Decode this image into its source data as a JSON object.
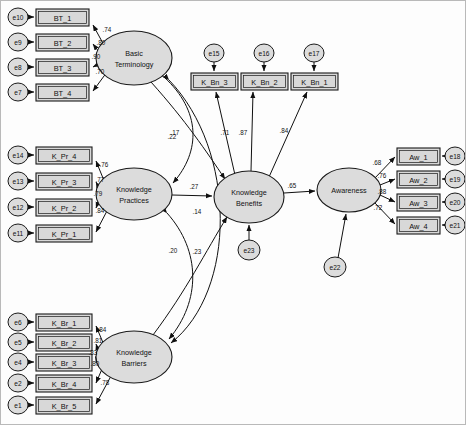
{
  "diagram": {
    "type": "sem-path-diagram",
    "latents": [
      {
        "id": "BT",
        "label_line1": "Basic",
        "label_line2": "Terminology",
        "cx": 133,
        "cy": 57,
        "rx": 38,
        "ry": 27
      },
      {
        "id": "KP",
        "label_line1": "Knowledge",
        "label_line2": "Practices",
        "cx": 133,
        "cy": 193,
        "rx": 38,
        "ry": 26
      },
      {
        "id": "KB",
        "label_line1": "Knowledge",
        "label_line2": "Barriers",
        "cx": 133,
        "cy": 356,
        "rx": 38,
        "ry": 26
      },
      {
        "id": "KBN",
        "label_line1": "Knowledge",
        "label_line2": "Benefits",
        "cx": 248,
        "cy": 196,
        "rx": 35,
        "ry": 26
      },
      {
        "id": "AW",
        "label_line1": "Awareness",
        "label_line2": "",
        "cx": 348,
        "cy": 189,
        "rx": 32,
        "ry": 22
      }
    ],
    "indicators": [
      {
        "id": "BT_1",
        "label": "BT_1",
        "x": 35,
        "y": 8,
        "w": 53,
        "h": 17,
        "err": "e10",
        "err_cx": 17,
        "err_cy": 16,
        "loading": ".74"
      },
      {
        "id": "BT_2",
        "label": "BT_2",
        "x": 35,
        "y": 33,
        "w": 53,
        "h": 17,
        "err": "e9",
        "err_cx": 17,
        "err_cy": 41,
        "loading": ".80"
      },
      {
        "id": "BT_3",
        "label": "BT_3",
        "x": 35,
        "y": 58,
        "w": 53,
        "h": 17,
        "err": "e8",
        "err_cx": 17,
        "err_cy": 66,
        "loading": ".90"
      },
      {
        "id": "BT_4",
        "label": "BT_4",
        "x": 35,
        "y": 83,
        "w": 53,
        "h": 17,
        "err": "e7",
        "err_cx": 17,
        "err_cy": 91,
        "loading": ".70"
      },
      {
        "id": "K_Pr_4",
        "label": "K_Pr_4",
        "x": 35,
        "y": 146,
        "w": 56,
        "h": 17,
        "err": "e14",
        "err_cx": 17,
        "err_cy": 154,
        "loading": ".76"
      },
      {
        "id": "K_Pr_3",
        "label": "K_Pr_3",
        "x": 35,
        "y": 172,
        "w": 56,
        "h": 17,
        "err": "e13",
        "err_cx": 17,
        "err_cy": 180,
        "loading": ".77"
      },
      {
        "id": "K_Pr_2",
        "label": "K_Pr_2",
        "x": 35,
        "y": 198,
        "w": 56,
        "h": 17,
        "err": "e12",
        "err_cx": 17,
        "err_cy": 206,
        "loading": ".79"
      },
      {
        "id": "K_Pr_1",
        "label": "K_Pr_1",
        "x": 35,
        "y": 224,
        "w": 56,
        "h": 17,
        "err": "e11",
        "err_cx": 17,
        "err_cy": 232,
        "loading": ".84"
      },
      {
        "id": "K_Br_1",
        "label": "K_Br_1",
        "x": 35,
        "y": 313,
        "w": 56,
        "h": 17,
        "err": "e6",
        "err_cx": 17,
        "err_cy": 321,
        "loading": ".84"
      },
      {
        "id": "K_Br_2",
        "label": "K_Br_2",
        "x": 35,
        "y": 333,
        "w": 56,
        "h": 17,
        "err": "e5",
        "err_cx": 17,
        "err_cy": 341,
        "loading": ".81"
      },
      {
        "id": "K_Br_3",
        "label": "K_Br_3",
        "x": 35,
        "y": 353,
        "w": 56,
        "h": 17,
        "err": "e4",
        "err_cx": 17,
        "err_cy": 361,
        "loading": ".83"
      },
      {
        "id": "K_Br_4",
        "label": "K_Br_4",
        "x": 35,
        "y": 374,
        "w": 56,
        "h": 17,
        "err": "e2",
        "err_cx": 17,
        "err_cy": 382,
        "loading": ".80"
      },
      {
        "id": "K_Br_5",
        "label": "K_Br_5",
        "x": 35,
        "y": 396,
        "w": 56,
        "h": 17,
        "err": "e1",
        "err_cx": 17,
        "err_cy": 404,
        "loading": ".78"
      },
      {
        "id": "K_Bn_3",
        "label": "K_Bn_3",
        "x": 190,
        "y": 72,
        "w": 47,
        "h": 17,
        "err": "e15",
        "err_cx": 213,
        "err_cy": 52,
        "loading": ".71"
      },
      {
        "id": "K_Bn_2",
        "label": "K_Bn_2",
        "x": 240,
        "y": 72,
        "w": 47,
        "h": 17,
        "err": "e16",
        "err_cx": 263,
        "err_cy": 52,
        "loading": ".87"
      },
      {
        "id": "K_Bn_1",
        "label": "K_Bn_1",
        "x": 290,
        "y": 72,
        "w": 47,
        "h": 17,
        "err": "e17",
        "err_cx": 313,
        "err_cy": 52,
        "loading": ".84"
      },
      {
        "id": "Aw_1",
        "label": "Aw_1",
        "x": 396,
        "y": 147,
        "w": 43,
        "h": 17,
        "err": "e18",
        "err_cx": 454,
        "err_cy": 155,
        "loading": ".68"
      },
      {
        "id": "Aw_2",
        "label": "Aw_2",
        "x": 396,
        "y": 170,
        "w": 43,
        "h": 17,
        "err": "e19",
        "err_cx": 454,
        "err_cy": 178,
        "loading": ".76"
      },
      {
        "id": "Aw_3",
        "label": "Aw_3",
        "x": 396,
        "y": 193,
        "w": 43,
        "h": 17,
        "err": "e20",
        "err_cx": 454,
        "err_cy": 201,
        "loading": ".88"
      },
      {
        "id": "Aw_4",
        "label": "Aw_4",
        "x": 396,
        "y": 216,
        "w": 43,
        "h": 17,
        "err": "e21",
        "err_cx": 454,
        "err_cy": 224,
        "loading": ".72"
      }
    ],
    "residuals": [
      {
        "id": "e23",
        "label": "e23",
        "cx": 248,
        "cy": 249,
        "target": "KBN"
      },
      {
        "id": "e22",
        "label": "e22",
        "cx": 334,
        "cy": 266,
        "target": "AW"
      }
    ],
    "structural_paths": [
      {
        "from": "BT",
        "to": "KBN",
        "coef": ".17",
        "label_x": 174,
        "label_y": 131
      },
      {
        "from": "KP",
        "to": "KBN",
        "coef": ".27",
        "label_x": 193,
        "label_y": 185
      },
      {
        "from": "KB",
        "to": "KBN",
        "coef": ".14",
        "label_x": 196,
        "label_y": 210
      },
      {
        "from": "KBN",
        "to": "AW",
        "coef": ".65",
        "label_x": 291,
        "label_y": 184
      }
    ],
    "correlations": [
      {
        "between": [
          "BT",
          "KP"
        ],
        "coef": ".22",
        "label_x": 171,
        "label_y": 135
      },
      {
        "between": [
          "KP",
          "KB"
        ],
        "coef": ".20",
        "label_x": 172,
        "label_y": 249
      },
      {
        "between": [
          "BT",
          "KB"
        ],
        "coef": ".23",
        "label_x": 196,
        "label_y": 250
      }
    ],
    "colors": {
      "stroke": "#101010",
      "box_fill": "#d8d8d8",
      "ellipse_fill": "#dcdcdc",
      "background": "#fdfdfd",
      "border": "#b9b9b9"
    }
  }
}
